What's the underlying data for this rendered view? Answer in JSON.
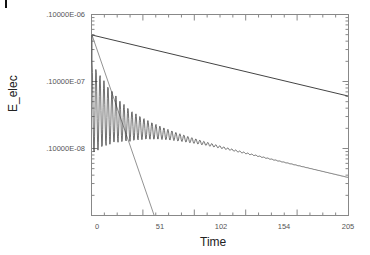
{
  "chart_data": {
    "type": "line",
    "title": "",
    "xlabel": "Time",
    "ylabel": "E_elec",
    "xlim": [
      0,
      205
    ],
    "ylim": [
      1e-09,
      1e-06
    ],
    "yscale": "log",
    "x_ticks": [
      "0",
      "51",
      "102",
      "154",
      "205"
    ],
    "y_ticks": [
      ".10000E-06",
      ".10000E-07",
      ".10000E-08"
    ],
    "grid": false,
    "legend": null,
    "series": [
      {
        "name": "upper reference line",
        "x": [
          0,
          205
        ],
        "y": [
          4.9e-07,
          6e-08
        ]
      },
      {
        "name": "steep reference line",
        "x": [
          0,
          51
        ],
        "y": [
          4.9e-07,
          1e-09
        ]
      },
      {
        "name": "E_elec (damped oscillation)",
        "x": [
          0,
          5,
          10,
          20,
          30,
          40,
          51,
          70,
          90,
          102,
          130,
          154,
          180,
          205
        ],
        "y_upper": [
          4.9e-07,
          1.6e-07,
          1.3e-07,
          8e-08,
          5.5e-08,
          4e-08,
          3e-08,
          2.2e-08,
          1.7e-08,
          1.4e-08,
          9.5e-09,
          7.5e-09,
          5.5e-09,
          3.7e-09
        ],
        "y_lower": [
          4.9e-07,
          1e-08,
          1.2e-08,
          1.5e-08,
          1.8e-08,
          2e-08,
          2.1e-08,
          2e-08,
          1.6e-08,
          1.4e-08,
          9.5e-09,
          7.5e-09,
          5.5e-09,
          3.7e-09
        ]
      }
    ]
  },
  "labels": {
    "ylabel": "E_elec",
    "xlabel": "Time",
    "yticks": [
      ".10000E-06",
      ".10000E-07",
      ".10000E-08"
    ],
    "xticks": [
      "0",
      "51",
      "102",
      "154",
      "205"
    ]
  }
}
